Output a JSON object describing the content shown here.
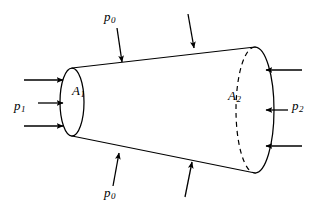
{
  "figure": {
    "background_color": "#ffffff",
    "stroke_color": "#000000",
    "labels": {
      "p0_top": {
        "base": "p",
        "sub": "0"
      },
      "p0_bottom": {
        "base": "p",
        "sub": "0"
      },
      "p1": {
        "base": "p",
        "sub": "1"
      },
      "p2": {
        "base": "p",
        "sub": "2"
      },
      "a1": {
        "base": "A",
        "sub": "1"
      },
      "a2": {
        "base": "A",
        "sub": "2"
      }
    },
    "body": {
      "shape": "truncated-cone",
      "left_face": {
        "name": "A1",
        "center_x": 72,
        "center_y": 102,
        "rx": 12,
        "ry": 34
      },
      "right_face": {
        "name": "A2",
        "center_x": 255,
        "center_y": 110,
        "rx": 19,
        "ry": 63,
        "hidden_arc": "dashed-back-half"
      },
      "top_edge": {
        "x1": 72,
        "y1": 68,
        "x2": 255,
        "y2": 47
      },
      "bottom_edge": {
        "x1": 72,
        "y1": 136,
        "x2": 255,
        "y2": 173
      }
    },
    "arrows": {
      "p1_group": [
        {
          "x1": 24,
          "y1": 80,
          "x2": 63,
          "y2": 80,
          "direction": "right"
        },
        {
          "x1": 38,
          "y1": 103,
          "x2": 63,
          "y2": 103,
          "direction": "right"
        },
        {
          "x1": 24,
          "y1": 126,
          "x2": 63,
          "y2": 126,
          "direction": "right"
        }
      ],
      "p2_group": [
        {
          "x1": 302,
          "y1": 70,
          "x2": 266,
          "y2": 70,
          "direction": "left"
        },
        {
          "x1": 288,
          "y1": 110,
          "x2": 266,
          "y2": 110,
          "direction": "left"
        },
        {
          "x1": 302,
          "y1": 146,
          "x2": 266,
          "y2": 146,
          "direction": "left"
        }
      ],
      "p0_top_group": [
        {
          "x1": 117,
          "y1": 28,
          "x2": 122,
          "y2": 62,
          "direction": "down"
        },
        {
          "x1": 188,
          "y1": 14,
          "x2": 194,
          "y2": 48,
          "direction": "down"
        }
      ],
      "p0_bottom_group": [
        {
          "x1": 113,
          "y1": 186,
          "x2": 119,
          "y2": 153,
          "direction": "up"
        },
        {
          "x1": 185,
          "y1": 197,
          "x2": 192,
          "y2": 162,
          "direction": "up"
        }
      ]
    }
  }
}
